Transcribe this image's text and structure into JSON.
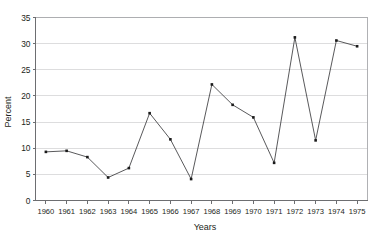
{
  "chart_data": {
    "type": "line",
    "title": "",
    "subtitle": "",
    "xlabel": "Years",
    "ylabel": "Percent",
    "categories": [
      "1960",
      "1961",
      "1962",
      "1963",
      "1964",
      "1965",
      "1966",
      "1967",
      "1968",
      "1969",
      "1970",
      "1971",
      "1972",
      "1973",
      "1974",
      "1975"
    ],
    "x": [
      1960,
      1961,
      1962,
      1963,
      1964,
      1965,
      1966,
      1967,
      1968,
      1969,
      1970,
      1971,
      1972,
      1973,
      1974,
      1975
    ],
    "values": [
      9.3,
      9.5,
      8.3,
      4.4,
      6.2,
      16.7,
      11.7,
      4.1,
      22.2,
      18.3,
      15.9,
      7.2,
      31.2,
      11.5,
      30.6,
      29.5
    ],
    "series": [
      {
        "name": "Percent",
        "values": [
          9.3,
          9.5,
          8.3,
          4.4,
          6.2,
          16.7,
          11.7,
          4.1,
          22.2,
          18.3,
          15.9,
          7.2,
          31.2,
          11.5,
          30.6,
          29.5
        ]
      }
    ],
    "ylim": [
      0,
      35
    ],
    "yticks": [
      0,
      5,
      10,
      15,
      20,
      25,
      30,
      35
    ],
    "ytick_labels": [
      "0",
      "5",
      "10",
      "15",
      "20",
      "25",
      "30",
      "35"
    ],
    "xtick_labels": [
      "1960",
      "1961",
      "1962",
      "1963",
      "1964",
      "1965",
      "1966",
      "1967",
      "1968",
      "1969",
      "1970",
      "1971",
      "1972",
      "1973",
      "1974",
      "1975"
    ],
    "grid": "horizontal",
    "legend": "none",
    "marker": "filled-square",
    "annotations": [],
    "colors": {
      "line": "#3b3b3d",
      "marker": "#1a1a1a",
      "gridline": "#d4d4d6",
      "frame": "#a7a9ac",
      "axis": "#6d6e71",
      "text": "#231f20",
      "background": "#ffffff"
    }
  }
}
